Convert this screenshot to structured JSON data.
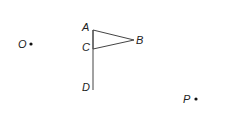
{
  "diagram": {
    "points": {
      "A": {
        "label": "A",
        "x": 93,
        "y": 30
      },
      "B": {
        "label": "B",
        "x": 134,
        "y": 40
      },
      "C": {
        "label": "C",
        "x": 93,
        "y": 49
      },
      "D": {
        "label": "D",
        "x": 93,
        "y": 90
      },
      "O": {
        "label": "O",
        "x": 31,
        "y": 44
      },
      "P": {
        "label": "P",
        "x": 196,
        "y": 99
      }
    },
    "colors": {
      "stroke": "#444444",
      "text": "#222222"
    }
  }
}
